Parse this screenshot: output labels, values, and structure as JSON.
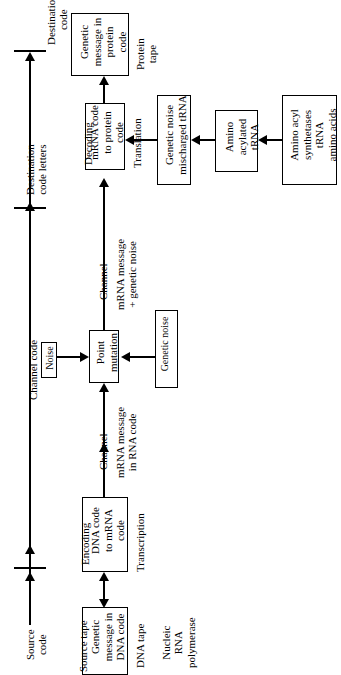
{
  "figure": {
    "orientation": "rotated-90-ccw",
    "ink_color": "#000000",
    "background_color": "#ffffff"
  },
  "axis": {
    "name": "channel-axis",
    "segments": [
      {
        "id": "source-code",
        "label": "Source\ncode"
      },
      {
        "id": "channel-code",
        "label": "Channel code"
      },
      {
        "id": "destination-code-letters",
        "label": "Destination\ncode letters"
      },
      {
        "id": "destination-code",
        "label": "Destination\ncode"
      }
    ]
  },
  "boxes": {
    "protein_tape": {
      "label": "Genetic\nmessage in\nprotein\ncode"
    },
    "decoding": {
      "label": "mRNA code\nto protein\ncode"
    },
    "mischarged_trna": {
      "label": "Genetic noise\nmischarged tRNA"
    },
    "amino_acylated": {
      "label": "Amino\nacylated\ntRNA"
    },
    "synthetases": {
      "label": "Amino acyl\nsynthetases\ntRNA\namino acids"
    },
    "point_mutation": {
      "label": "Point\nmutation"
    },
    "noise": {
      "label": "Noise"
    },
    "genetic_noise": {
      "label": "Genetic noise"
    },
    "encoding": {
      "label": "DNA code\nto mRNA\ncode"
    },
    "source_tape": {
      "label": "Genetic\nmessage in\nDNA code"
    }
  },
  "annotations": {
    "protein_tape_caption": "Protein\ntape",
    "decoding_caption": "Decoding",
    "translation_caption": "Translation",
    "channel_upper": "Channel",
    "channel_upper_payload": "mRNA message\n+ genetic noise",
    "channel_lower": "Channel",
    "channel_lower_payload": "mRNA message\nin RNA code",
    "encoding_caption": "Encoding",
    "transcription_caption": "Transcription",
    "source_tape_caption": "Source tape",
    "dna_tape_caption": "DNA tape",
    "polymerase_caption": "Nucleic\nRNA\npolymerase"
  }
}
